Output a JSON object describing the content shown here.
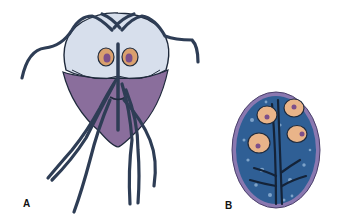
{
  "figure": {
    "panels": [
      {
        "id": "A",
        "label": "A",
        "subject": "trophozoite"
      },
      {
        "id": "B",
        "label": "B",
        "subject": "cyst"
      }
    ],
    "colors": {
      "flagella": "#2e3d55",
      "body_upper": "#d7dfec",
      "body_lower": "#8a6e9c",
      "nucleus_ring": "#d9a06e",
      "nucleus_core": "#7d4f8a",
      "cyst_wall": "#8a78b0",
      "cyst_fill": "#2f5f95",
      "cyst_nucleus": "#e9b489",
      "outline": "#1f2a3c"
    }
  }
}
